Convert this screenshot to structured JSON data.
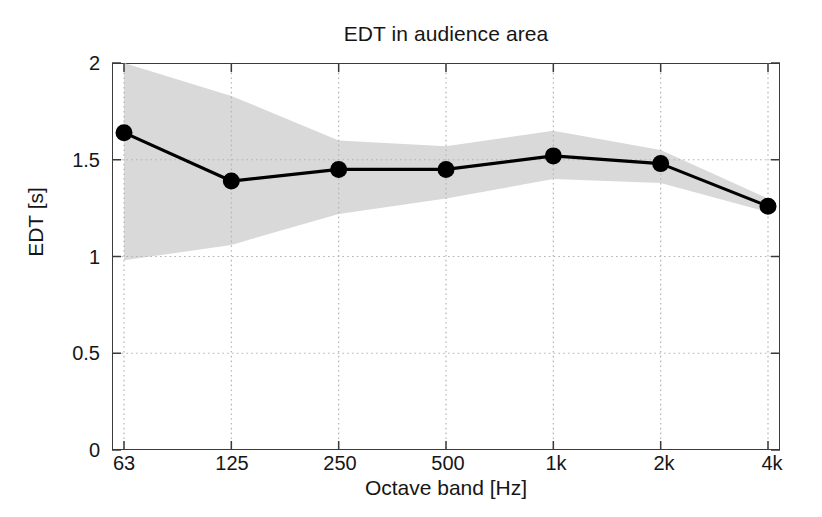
{
  "chart_data": {
    "type": "line",
    "title": "EDT in audience area",
    "xlabel": "Octave band [Hz]",
    "ylabel": "EDT [s]",
    "categories": [
      "63",
      "125",
      "250",
      "500",
      "1k",
      "2k",
      "4k"
    ],
    "values": [
      1.64,
      1.39,
      1.45,
      1.45,
      1.52,
      1.48,
      1.26
    ],
    "series": [
      {
        "name": "EDT mean",
        "values": [
          1.64,
          1.39,
          1.45,
          1.45,
          1.52,
          1.48,
          1.26
        ],
        "marker": "filled-circle",
        "color": "#000000"
      },
      {
        "name": "spread band upper",
        "values": [
          2.0,
          1.83,
          1.6,
          1.57,
          1.65,
          1.55,
          1.3
        ],
        "color": "#d9d9d9"
      },
      {
        "name": "spread band lower",
        "values": [
          0.98,
          1.06,
          1.22,
          1.3,
          1.4,
          1.38,
          1.23
        ],
        "color": "#d9d9d9"
      }
    ],
    "ylim": [
      0,
      2
    ],
    "yticks": [
      "0",
      "0.5",
      "1",
      "1.5",
      "2"
    ],
    "ytick_values": [
      0,
      0.5,
      1,
      1.5,
      2
    ],
    "xticks": [
      "63",
      "125",
      "250",
      "500",
      "1k",
      "2k",
      "4k"
    ],
    "grid": true,
    "grid_style": "dotted",
    "grid_color": "#b5b5b5",
    "legend": "none",
    "band_color": "#d9d9d9",
    "line_color": "#000000",
    "axis_color": "#3a3a3a",
    "background": "#ffffff"
  },
  "figure": {
    "title": "EDT in audience area",
    "xlabel": "Octave band [Hz]",
    "ylabel": "EDT [s]"
  }
}
